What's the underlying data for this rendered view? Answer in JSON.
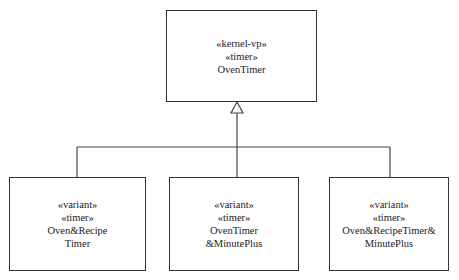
{
  "diagram": {
    "type": "UML class diagram (generalization)",
    "parent": {
      "stereotypes": [
        "«kernel-vp»",
        "«timer»"
      ],
      "name": "OvenTimer"
    },
    "children": [
      {
        "stereotypes": [
          "«variant»",
          "«timer»"
        ],
        "name_lines": [
          "Oven&Recipe",
          "Timer"
        ]
      },
      {
        "stereotypes": [
          "«variant»",
          "«timer»"
        ],
        "name_lines": [
          "OvenTimer",
          "&MinutePlus"
        ]
      },
      {
        "stereotypes": [
          "«variant»",
          "«timer»"
        ],
        "name_lines": [
          "Oven&RecipeTimer&",
          "MinutePlus"
        ]
      }
    ],
    "relationship": "generalization",
    "line_color": "#333333"
  }
}
